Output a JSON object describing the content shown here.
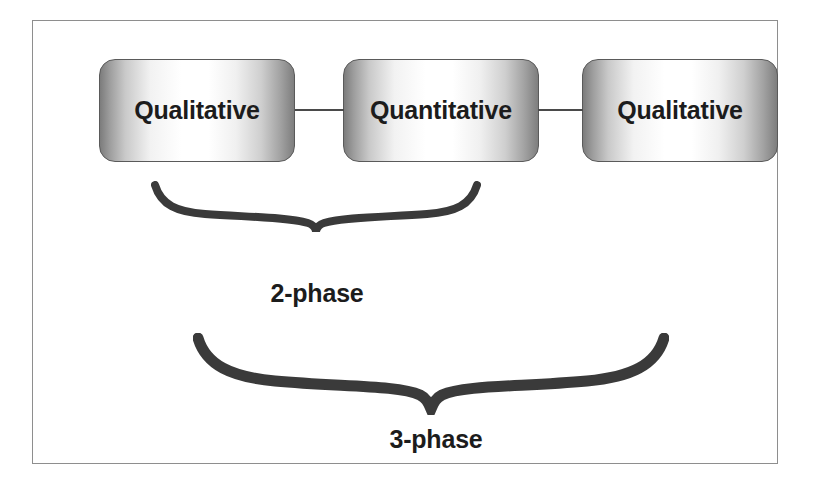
{
  "figure": {
    "caption_absent": true,
    "background_color": "#ffffff",
    "frame_border_color": "#8e8e8e"
  },
  "boxes": [
    {
      "id": "qualitative-1",
      "label": "Qualitative"
    },
    {
      "id": "quantitative",
      "label": "Quantitative"
    },
    {
      "id": "qualitative-2",
      "label": "Qualitative"
    }
  ],
  "connectors": [
    {
      "id": "connector-1",
      "from": "qualitative-1",
      "to": "quantitative",
      "color": "#4a4a4a"
    },
    {
      "id": "connector-2",
      "from": "quantitative",
      "to": "qualitative-2",
      "color": "#4a4a4a"
    }
  ],
  "braces": [
    {
      "id": "brace-2phase",
      "spans": "qualitative-1,quantitative",
      "label": "2-phase",
      "color": "#3a3a3a"
    },
    {
      "id": "brace-3phase",
      "spans": "qualitative-1,quantitative,qualitative-2",
      "label": "3-phase",
      "color": "#3a3a3a"
    }
  ],
  "labels": {
    "two_phase": "2-phase",
    "three_phase": "3-phase"
  },
  "colors": {
    "box_border": "#5a5a5a",
    "box_gradient_edge": "#7c7c7c",
    "box_gradient_center": "#ffffff",
    "text": "#1c1c1c",
    "brace": "#3a3a3a",
    "frame": "#8e8e8e"
  }
}
